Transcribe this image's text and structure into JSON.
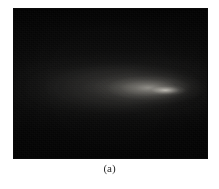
{
  "figure": {
    "caption": "(a)",
    "panel": {
      "alt_name": "dark-plume-photograph",
      "background_color": "#050505",
      "plume_highlight_color": "#cdcac1",
      "tip_highlight_color": "#e2dfd6"
    }
  },
  "page": {
    "background_color": "#ffffff"
  },
  "chart_data": {
    "type": "heatmap",
    "title": "",
    "subtitle": "",
    "xlabel": "",
    "ylabel": "",
    "grid": false,
    "legend": null,
    "colormap": "grayscale",
    "value_range": [
      0,
      255
    ],
    "x": [
      0,
      0.1,
      0.2,
      0.3,
      0.4,
      0.5,
      0.6,
      0.7,
      0.8,
      0.9,
      1.0
    ],
    "y": [
      0,
      0.1,
      0.2,
      0.3,
      0.4,
      0.5,
      0.6,
      0.7,
      0.8,
      0.9,
      1.0
    ],
    "values": [
      [
        2,
        3,
        3,
        4,
        4,
        4,
        4,
        3,
        3,
        2,
        2
      ],
      [
        3,
        4,
        5,
        6,
        6,
        6,
        6,
        5,
        4,
        3,
        2
      ],
      [
        4,
        6,
        8,
        10,
        11,
        12,
        12,
        10,
        7,
        4,
        3
      ],
      [
        5,
        8,
        12,
        16,
        19,
        22,
        24,
        20,
        12,
        6,
        3
      ],
      [
        6,
        11,
        17,
        24,
        31,
        38,
        44,
        38,
        20,
        8,
        4
      ],
      [
        7,
        13,
        21,
        31,
        42,
        55,
        72,
        86,
        40,
        11,
        4
      ],
      [
        6,
        12,
        19,
        28,
        37,
        47,
        58,
        62,
        28,
        9,
        4
      ],
      [
        5,
        9,
        14,
        20,
        26,
        31,
        34,
        30,
        16,
        6,
        3
      ],
      [
        4,
        6,
        9,
        12,
        15,
        17,
        18,
        15,
        9,
        4,
        2
      ],
      [
        3,
        4,
        6,
        7,
        8,
        9,
        9,
        8,
        5,
        3,
        2
      ],
      [
        2,
        3,
        3,
        4,
        4,
        5,
        5,
        4,
        3,
        2,
        2
      ]
    ],
    "annotations": [
      {
        "label": "(a)",
        "position": "below-figure"
      }
    ]
  }
}
